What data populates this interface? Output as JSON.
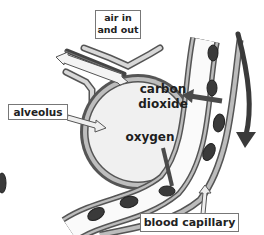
{
  "diagram": {
    "labels": {
      "air": {
        "line1": "air in",
        "line2": "and out"
      },
      "alveolus": "alveolus",
      "carbon_dioxide": {
        "line1": "carbon",
        "line2": "dioxide"
      },
      "oxygen": "oxygen",
      "capillary": "blood capillary"
    },
    "colors": {
      "background": "#ffffff",
      "alveolus_fill": "#f0f0f0",
      "wall": "#9a9a9a",
      "wall_outline": "#555555",
      "red_cell": "#3a3a3a",
      "arrow_dark": "#4a4a4a",
      "arrow_light": "#e6e6e6",
      "text": "#222222"
    }
  }
}
